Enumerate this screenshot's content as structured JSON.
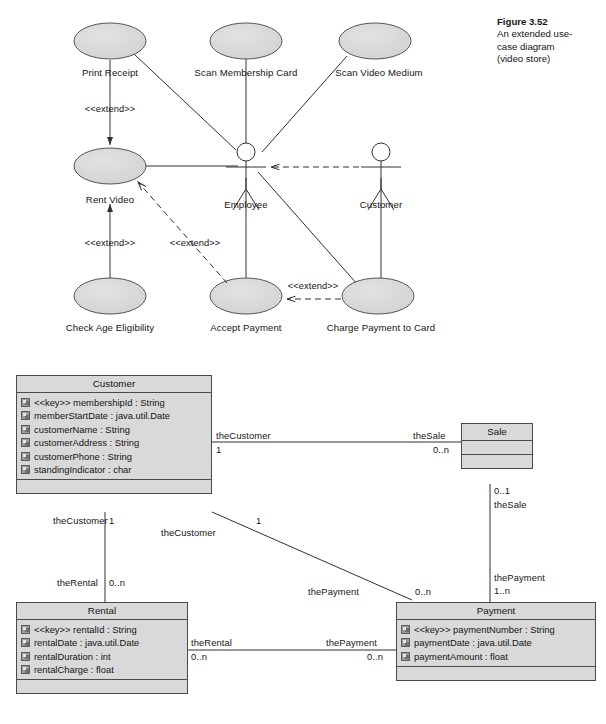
{
  "figure": {
    "number": "Figure 3.52",
    "caption_line1": "An extended use-",
    "caption_line2": "case diagram",
    "caption_line3": "(video store)"
  },
  "use_case_diagram": {
    "title": "An extended use-case diagram (video store)",
    "actors": [
      {
        "id": "employee",
        "label": "Employee"
      },
      {
        "id": "customer",
        "label": "Customer"
      }
    ],
    "use_cases": [
      {
        "id": "print-receipt",
        "label": "Print Receipt"
      },
      {
        "id": "scan-membership-card",
        "label": "Scan Membership Card"
      },
      {
        "id": "scan-video-medium",
        "label": "Scan Video Medium"
      },
      {
        "id": "rent-video",
        "label": "Rent Video"
      },
      {
        "id": "check-age-eligibility",
        "label": "Check Age Eligibility"
      },
      {
        "id": "accept-payment",
        "label": "Accept Payment"
      },
      {
        "id": "charge-payment-to-card",
        "label": "Charge Payment to Card"
      }
    ],
    "stereotypes": [
      {
        "id": "extend-print-receipt",
        "label": "<<extend>>"
      },
      {
        "id": "extend-check-age",
        "label": "<<extend>>"
      },
      {
        "id": "extend-accept-payment",
        "label": "<<extend>>"
      },
      {
        "id": "extend-charge-card",
        "label": "<<extend>>"
      }
    ],
    "associations": [
      {
        "from": "print-receipt",
        "to": "rent-video",
        "type": "extend"
      },
      {
        "from": "check-age-eligibility",
        "to": "rent-video",
        "type": "extend"
      },
      {
        "from": "accept-payment",
        "to": "rent-video",
        "type": "extend"
      },
      {
        "from": "charge-payment-to-card",
        "to": "accept-payment",
        "type": "extend"
      },
      {
        "from": "customer",
        "to": "employee",
        "type": "dependency"
      },
      {
        "from": "employee",
        "to": "rent-video",
        "type": "association"
      },
      {
        "from": "employee",
        "to": "print-receipt",
        "type": "association"
      },
      {
        "from": "employee",
        "to": "scan-membership-card",
        "type": "association"
      },
      {
        "from": "employee",
        "to": "scan-video-medium",
        "type": "association"
      },
      {
        "from": "employee",
        "to": "accept-payment",
        "type": "association"
      },
      {
        "from": "employee",
        "to": "charge-payment-to-card",
        "type": "association"
      },
      {
        "from": "customer",
        "to": "charge-payment-to-card",
        "type": "association"
      }
    ]
  },
  "class_diagram": {
    "classes": [
      {
        "id": "customer",
        "name": "Customer",
        "attributes": [
          "<<key>> membershipId : String",
          "memberStartDate : java.util.Date",
          "customerName : String",
          "customerAddress : String",
          "customerPhone : String",
          "standingIndicator : char"
        ],
        "operations": []
      },
      {
        "id": "sale",
        "name": "Sale",
        "attributes": [],
        "operations": []
      },
      {
        "id": "rental",
        "name": "Rental",
        "attributes": [
          "<<key>> rentalId : String",
          "rentalDate : java.util.Date",
          "rentalDuration : int",
          "rentalCharge : float"
        ],
        "operations": []
      },
      {
        "id": "payment",
        "name": "Payment",
        "attributes": [
          "<<key>> paymentNumber : String",
          "paymentDate : java.util.Date",
          "paymentAmount : float"
        ],
        "operations": []
      }
    ],
    "associations": [
      {
        "id": "customer-sale",
        "from": "customer",
        "to": "sale",
        "from_role": "theCustomer",
        "from_multiplicity": "1",
        "to_role": "theSale",
        "to_multiplicity": "0..n"
      },
      {
        "id": "customer-rental",
        "from": "customer",
        "to": "rental",
        "from_role": "theCustomer",
        "from_multiplicity": "1",
        "to_role": "theRental",
        "to_multiplicity": "0..n"
      },
      {
        "id": "customer-payment",
        "from": "customer",
        "to": "payment",
        "from_role": "theCustomer",
        "from_multiplicity": "1",
        "to_role": "thePayment",
        "to_multiplicity": "0..n"
      },
      {
        "id": "sale-payment",
        "from": "sale",
        "to": "payment",
        "from_role": "theSale",
        "from_multiplicity": "0..1",
        "to_role": "thePayment",
        "to_multiplicity": "1..n"
      },
      {
        "id": "rental-payment",
        "from": "rental",
        "to": "payment",
        "from_role": "theRental",
        "from_multiplicity": "0..n",
        "to_role": "thePayment",
        "to_multiplicity": "0..n"
      }
    ]
  },
  "colors": {
    "fill": "#d9d9d9",
    "stroke": "#4a4a4a",
    "line": "#303030",
    "text": "#141414",
    "background": "#ffffff"
  }
}
